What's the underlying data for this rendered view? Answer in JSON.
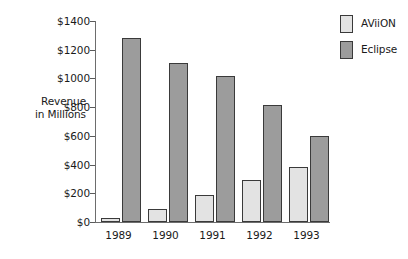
{
  "chart_data": {
    "type": "bar",
    "title": "",
    "xlabel": "",
    "ylabel": "Revenue\nin Millions",
    "ylabel_line1": "Revenue",
    "ylabel_line2": "in Millions",
    "categories": [
      "1989",
      "1990",
      "1991",
      "1992",
      "1993"
    ],
    "series": [
      {
        "name": "AViiON",
        "color": "#e3e3e3",
        "values": [
          30,
          90,
          190,
          295,
          385
        ]
      },
      {
        "name": "Eclipse",
        "color": "#9c9c9c",
        "values": [
          1285,
          1110,
          1020,
          815,
          600
        ]
      }
    ],
    "ylim": [
      0,
      1400
    ],
    "ytick_values": [
      0,
      200,
      400,
      600,
      800,
      1000,
      1200,
      1400
    ],
    "ytick_labels": [
      "$0",
      "$200",
      "$400",
      "$600",
      "$800",
      "$1000",
      "$1200",
      "$1400"
    ],
    "grid": false,
    "legend_position": "top-right",
    "value_prefix": "$"
  },
  "legend": {
    "entries": [
      {
        "label": "AViiON",
        "color": "#e3e3e3"
      },
      {
        "label": "Eclipse",
        "color": "#9c9c9c"
      }
    ]
  },
  "colors": {
    "aviion": "#e3e3e3",
    "eclipse": "#9c9c9c",
    "outline": "#3a3a3a",
    "axis": "#6d6d6d",
    "text": "#1a1a1a",
    "background": "#ffffff"
  }
}
